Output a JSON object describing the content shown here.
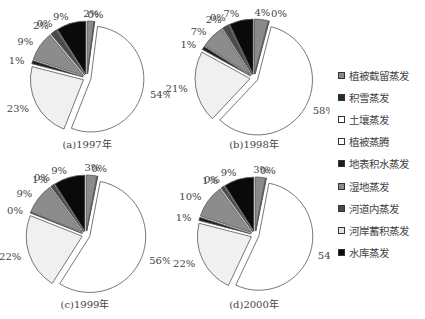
{
  "chart_data": [
    {
      "type": "pie",
      "title": "(a)1997年",
      "categories": [
        "植被截留蒸发",
        "积雪蒸发",
        "土壤蒸发",
        "植被蒸腾",
        "地表积水蒸发",
        "湿地蒸发",
        "河道内蒸发",
        "河岸蓄积蒸发",
        "水库蒸发"
      ],
      "values": [
        2,
        0,
        54,
        23,
        1,
        9,
        2,
        0,
        9
      ]
    },
    {
      "type": "pie",
      "title": "(b)1998年",
      "categories": [
        "植被截留蒸发",
        "积雪蒸发",
        "土壤蒸发",
        "植被蒸腾",
        "地表积水蒸发",
        "湿地蒸发",
        "河道内蒸发",
        "河岸蓄积蒸发",
        "水库蒸发"
      ],
      "values": [
        4,
        0,
        58,
        21,
        1,
        7,
        2,
        0,
        7
      ]
    },
    {
      "type": "pie",
      "title": "(c)1999年",
      "categories": [
        "植被截留蒸发",
        "积雪蒸发",
        "土壤蒸发",
        "植被蒸腾",
        "地表积水蒸发",
        "湿地蒸发",
        "河道内蒸发",
        "河岸蓄积蒸发",
        "水库蒸发"
      ],
      "values": [
        3,
        0,
        56,
        22,
        0,
        9,
        1,
        0,
        9
      ]
    },
    {
      "type": "pie",
      "title": "(d)2000年",
      "categories": [
        "植被截留蒸发",
        "积雪蒸发",
        "土壤蒸发",
        "植被蒸腾",
        "地表积水蒸发",
        "湿地蒸发",
        "河道内蒸发",
        "河岸蓄积蒸发",
        "水库蒸发"
      ],
      "values": [
        3,
        0,
        54,
        22,
        1,
        10,
        1,
        0,
        9
      ]
    }
  ],
  "legend": {
    "position": "right",
    "items": [
      {
        "label": "植被截留蒸发",
        "color": "#8a8a8a"
      },
      {
        "label": "积雪蒸发",
        "color": "#2a2a2a"
      },
      {
        "label": "土壤蒸发",
        "color": "#ffffff"
      },
      {
        "label": "植被蒸腾",
        "color": "#ffffff"
      },
      {
        "label": "地表积水蒸发",
        "color": "#1e1e1e"
      },
      {
        "label": "湿地蒸发",
        "color": "#8c8c8c"
      },
      {
        "label": "河道内蒸发",
        "color": "#4a4a4a"
      },
      {
        "label": "河岸蓄积蒸发",
        "color": "#e2e2e2"
      },
      {
        "label": "水库蒸发",
        "color": "#0a0a0a"
      }
    ]
  },
  "slice_colors": [
    "#8a8a8a",
    "#2a2a2a",
    "#ffffff",
    "#f0f0f0",
    "#1e1e1e",
    "#8c8c8c",
    "#4a4a4a",
    "#e2e2e2",
    "#0a0a0a"
  ],
  "pies": [
    {
      "caption": "(a)1997年"
    },
    {
      "caption": "(b)1998年"
    },
    {
      "caption": "(c)1999年"
    },
    {
      "caption": "(d)2000年"
    }
  ]
}
